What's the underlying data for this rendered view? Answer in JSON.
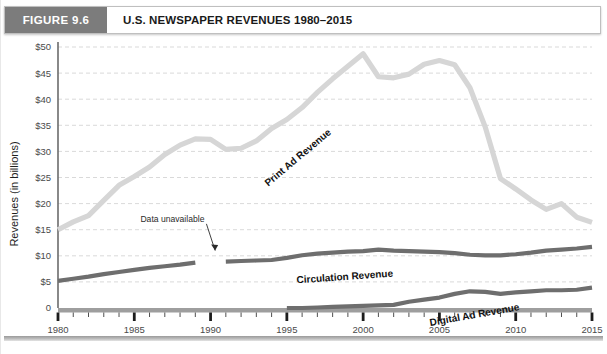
{
  "figure": {
    "badge": "FIGURE 9.6",
    "title": "U.S. NEWSPAPER REVENUES 1980–2015"
  },
  "colors": {
    "print_line": "#d6d6d6",
    "circulation_line": "#6e6e6e",
    "digital_line": "#6e6e6e",
    "badge_bg": "#7c7c7c",
    "grid": "#cfcfcf",
    "axis": "#6b6b6b",
    "text": "#1a1a1a"
  },
  "annotations": {
    "data_unavailable": "Data unavailable"
  },
  "chart_data": {
    "type": "line",
    "title": "U.S. NEWSPAPER REVENUES 1980–2015",
    "xlabel": "",
    "ylabel": "Revenues (in billions)",
    "xlim": [
      1980,
      2015
    ],
    "ylim": [
      0,
      50
    ],
    "grid": true,
    "legend": "inline-labels",
    "y_ticks": [
      0,
      5,
      10,
      15,
      20,
      25,
      30,
      35,
      40,
      45,
      50
    ],
    "y_tick_labels": [
      "0",
      "$5",
      "$10",
      "$15",
      "$20",
      "$25",
      "$30",
      "$35",
      "$40",
      "$45",
      "$50"
    ],
    "x_ticks": [
      1980,
      1981,
      1982,
      1983,
      1984,
      1985,
      1986,
      1987,
      1988,
      1989,
      1990,
      1991,
      1992,
      1993,
      1994,
      1995,
      1996,
      1997,
      1998,
      1999,
      2000,
      2001,
      2002,
      2003,
      2004,
      2005,
      2006,
      2007,
      2008,
      2009,
      2010,
      2011,
      2012,
      2013,
      2014,
      2015
    ],
    "x_tick_labels": [
      "1980",
      "1985",
      "1990",
      "1995",
      "2000",
      "2005",
      "2010",
      "2015"
    ],
    "x_labeled_ticks": [
      1980,
      1985,
      1990,
      1995,
      2000,
      2005,
      2010,
      2015
    ],
    "series": [
      {
        "name": "Print Ad Revenue",
        "color": "#d6d6d6",
        "x": [
          1980,
          1981,
          1982,
          1983,
          1984,
          1985,
          1986,
          1987,
          1988,
          1989,
          1990,
          1991,
          1992,
          1993,
          1994,
          1995,
          1996,
          1997,
          1998,
          1999,
          2000,
          2001,
          2002,
          2003,
          2004,
          2005,
          2006,
          2007,
          2008,
          2009,
          2010,
          2011,
          2012,
          2013,
          2014,
          2015
        ],
        "values": [
          15.0,
          16.5,
          17.7,
          20.6,
          23.5,
          25.2,
          27.0,
          29.4,
          31.2,
          32.4,
          32.3,
          30.4,
          30.6,
          32.0,
          34.4,
          36.1,
          38.4,
          41.3,
          43.9,
          46.3,
          48.7,
          44.3,
          44.1,
          44.8,
          46.7,
          47.4,
          46.6,
          42.2,
          34.7,
          24.8,
          22.8,
          20.7,
          18.9,
          20.0,
          17.4,
          16.4
        ]
      },
      {
        "name": "Circulation Revenue",
        "color": "#6e6e6e",
        "x": [
          1980,
          1981,
          1982,
          1983,
          1984,
          1985,
          1986,
          1987,
          1988,
          1989
        ],
        "values": [
          5.2,
          5.6,
          6.0,
          6.5,
          6.9,
          7.3,
          7.7,
          8.0,
          8.3,
          8.7
        ],
        "segment": "pre-gap"
      },
      {
        "name": "Circulation Revenue",
        "color": "#6e6e6e",
        "x": [
          1991,
          1992,
          1993,
          1994,
          1995,
          1996,
          1997,
          1998,
          1999,
          2000,
          2001,
          2002,
          2003,
          2004,
          2005,
          2006,
          2007,
          2008,
          2009,
          2010,
          2011,
          2012,
          2013,
          2014,
          2015
        ],
        "values": [
          8.9,
          9.0,
          9.1,
          9.2,
          9.6,
          10.1,
          10.4,
          10.6,
          10.8,
          10.9,
          11.2,
          11.0,
          10.9,
          10.8,
          10.7,
          10.5,
          10.2,
          10.1,
          10.1,
          10.3,
          10.6,
          11.0,
          11.2,
          11.4,
          11.7
        ],
        "segment": "post-gap"
      },
      {
        "name": "Digital Ad Revenue",
        "color": "#6e6e6e",
        "x": [
          1995,
          1996,
          1997,
          1998,
          1999,
          2000,
          2001,
          2002,
          2003,
          2004,
          2005,
          2006,
          2007,
          2008,
          2009,
          2010,
          2011,
          2012,
          2013,
          2014,
          2015
        ],
        "values": [
          0.0,
          0.0,
          0.1,
          0.2,
          0.3,
          0.4,
          0.5,
          0.6,
          1.2,
          1.6,
          2.0,
          2.7,
          3.2,
          3.1,
          2.7,
          3.0,
          3.2,
          3.4,
          3.4,
          3.5,
          3.9
        ]
      }
    ],
    "annotations": [
      {
        "text": "Data unavailable",
        "x": 1987.5,
        "y": 16.5,
        "arrow_to_x": 1990.3,
        "arrow_to_y": 11.0
      }
    ]
  }
}
